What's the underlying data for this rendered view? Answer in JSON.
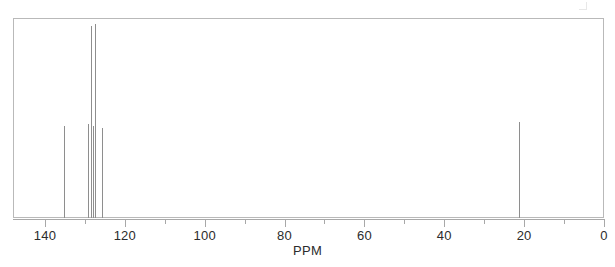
{
  "chart_data": {
    "type": "line",
    "title": "",
    "subtitle": "",
    "xlabel": "PPM",
    "ylabel": "",
    "xlim": [
      148.0,
      0.0
    ],
    "ylim": [
      0,
      100
    ],
    "axis_direction": "reversed",
    "grid": false,
    "legend": null,
    "tick_labels": [
      "140",
      "120",
      "100",
      "80",
      "60",
      "40",
      "20",
      "0"
    ],
    "tick_values": [
      140,
      120,
      100,
      80,
      60,
      40,
      20,
      0
    ],
    "minor_tick_values": [
      130,
      110,
      90,
      70,
      50,
      30,
      10
    ],
    "peaks": [
      {
        "ppm": 135.3,
        "intensity": 46
      },
      {
        "ppm": 129.2,
        "intensity": 47
      },
      {
        "ppm": 128.5,
        "intensity": 96
      },
      {
        "ppm": 128.0,
        "intensity": 46
      },
      {
        "ppm": 127.4,
        "intensity": 97
      },
      {
        "ppm": 125.8,
        "intensity": 45
      },
      {
        "ppm": 21.3,
        "intensity": 48
      }
    ],
    "annotations": []
  },
  "figure": {
    "axis_title": "PPM",
    "frame_color": "#b9b9b9",
    "peak_color": "#8e8e8e",
    "axis_color": "#a8a8a8",
    "label_color": "#2c2c2c",
    "background": "#ffffff"
  }
}
